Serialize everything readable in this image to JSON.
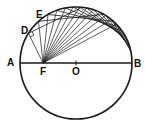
{
  "diagram": {
    "labels": {
      "A": "A",
      "B": "B",
      "O": "O",
      "F": "F",
      "D": "D",
      "E": "E"
    },
    "geometry": {
      "center": [
        76,
        63
      ],
      "radius": 56,
      "focus_F": [
        43,
        63
      ],
      "stroke_color": "#1a1a1a"
    }
  }
}
